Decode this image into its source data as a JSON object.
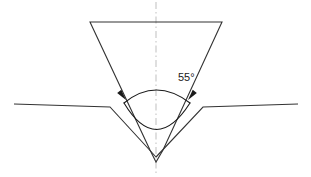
{
  "figure": {
    "kind": "engineering-line-drawing",
    "background_color": "#ffffff",
    "line_color": "#333333",
    "centerline_color": "#bfbfbf",
    "text_color": "#1a1a1a",
    "width": 311,
    "height": 177
  },
  "annotations": {
    "angle_dimension": {
      "value": "55",
      "unit": "°",
      "label": "55°",
      "label_x": 178,
      "label_y": 78
    }
  },
  "geometry": {
    "centerline": {
      "x": 156,
      "y_top": 2,
      "y_bottom": 175,
      "dash_pattern": "7,3,1.5,3"
    },
    "punch": {
      "top_left_x": 90,
      "top_right_x": 222,
      "top_y": 22,
      "apex_x": 156,
      "apex_y": 162,
      "tip_left_x": 150,
      "tip_right_x": 163,
      "tip_y": 150
    },
    "sheet_left": {
      "start_x": 14,
      "start_y": 104,
      "shoulder_x": 110,
      "shoulder_y": 107,
      "tip_x": 156,
      "tip_y": 157
    },
    "sheet_right": {
      "start_x": 298,
      "start_y": 104,
      "shoulder_x": 203,
      "shoulder_y": 107,
      "tip_x": 156,
      "tip_y": 157
    },
    "dimension_arc": {
      "left_x": 124,
      "left_y": 103,
      "right_x": 190,
      "right_y": 103,
      "apex_x": 156,
      "apex_y": 85,
      "bottom_apex_x": 156,
      "bottom_apex_y": 139
    },
    "arrowheads": [
      {
        "name": "left-arrowhead",
        "x": 126,
        "y": 100,
        "rotation": 232
      },
      {
        "name": "right-arrowhead",
        "x": 188,
        "y": 100,
        "rotation": 308
      }
    ]
  }
}
